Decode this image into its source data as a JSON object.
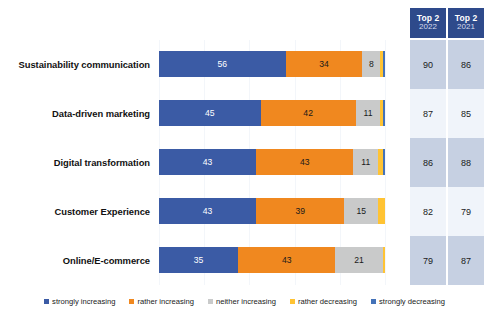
{
  "chart_data": {
    "type": "bar",
    "subtype": "stacked-horizontal-100",
    "title": "",
    "xlabel": "",
    "ylabel": "",
    "xlim": [
      0,
      100
    ],
    "grid": true,
    "legend_position": "bottom",
    "categories": [
      "Sustainability communication",
      "Data-driven marketing",
      "Digital transformation",
      "Customer Experience",
      "Online/E-commerce"
    ],
    "series": [
      {
        "name": "strongly increasing",
        "color": "#3B5BA5",
        "values": [
          56,
          45,
          43,
          43,
          35
        ]
      },
      {
        "name": "rather increasing",
        "color": "#F0881F",
        "values": [
          34,
          42,
          43,
          39,
          43
        ]
      },
      {
        "name": "neither increasing",
        "color": "#C9CACA",
        "values": [
          8,
          11,
          11,
          15,
          21
        ]
      },
      {
        "name": "rather decreasing",
        "color": "#FFC333",
        "values": [
          1,
          1,
          2,
          3,
          1
        ]
      },
      {
        "name": "strongly decreasing",
        "color": "#4472B8",
        "values": [
          1,
          1,
          1,
          0,
          0
        ]
      }
    ],
    "data_labels": {
      "strongly increasing": [
        "56",
        "45",
        "43",
        "43",
        "35"
      ],
      "rather increasing": [
        "34",
        "42",
        "43",
        "39",
        "43"
      ],
      "neither increasing": [
        "8",
        "11",
        "11",
        "15",
        "21"
      ],
      "rather decreasing": [
        "",
        "",
        "",
        "",
        ""
      ],
      "strongly decreasing": [
        "",
        "",
        "",
        "",
        ""
      ]
    },
    "annotation_columns": [
      {
        "title": "Top 2",
        "year": "2022",
        "values": [
          "90",
          "87",
          "86",
          "82",
          "79"
        ]
      },
      {
        "title": "Top 2",
        "year": "2021",
        "values": [
          "86",
          "85",
          "88",
          "79",
          "87"
        ]
      }
    ]
  },
  "header": {
    "columns": [
      {
        "title": "Top 2",
        "year": "2022"
      },
      {
        "title": "Top 2",
        "year": "2021"
      }
    ]
  },
  "rows": [
    {
      "label": "Sustainability communication",
      "segments": [
        {
          "key": "strong-inc",
          "value": 56,
          "label": "56"
        },
        {
          "key": "rather-inc",
          "value": 34,
          "label": "34"
        },
        {
          "key": "neither",
          "value": 8,
          "label": "8"
        },
        {
          "key": "rather-dec",
          "value": 1,
          "label": ""
        },
        {
          "key": "strong-dec",
          "value": 1,
          "label": ""
        }
      ],
      "top2_2022": "90",
      "top2_2021": "86"
    },
    {
      "label": "Data-driven marketing",
      "segments": [
        {
          "key": "strong-inc",
          "value": 45,
          "label": "45"
        },
        {
          "key": "rather-inc",
          "value": 42,
          "label": "42"
        },
        {
          "key": "neither",
          "value": 11,
          "label": "11"
        },
        {
          "key": "rather-dec",
          "value": 1,
          "label": ""
        },
        {
          "key": "strong-dec",
          "value": 1,
          "label": ""
        }
      ],
      "top2_2022": "87",
      "top2_2021": "85"
    },
    {
      "label": "Digital transformation",
      "segments": [
        {
          "key": "strong-inc",
          "value": 43,
          "label": "43"
        },
        {
          "key": "rather-inc",
          "value": 43,
          "label": "43"
        },
        {
          "key": "neither",
          "value": 11,
          "label": "11"
        },
        {
          "key": "rather-dec",
          "value": 2,
          "label": ""
        },
        {
          "key": "strong-dec",
          "value": 1,
          "label": ""
        }
      ],
      "top2_2022": "86",
      "top2_2021": "88"
    },
    {
      "label": "Customer Experience",
      "segments": [
        {
          "key": "strong-inc",
          "value": 43,
          "label": "43"
        },
        {
          "key": "rather-inc",
          "value": 39,
          "label": "39"
        },
        {
          "key": "neither",
          "value": 15,
          "label": "15"
        },
        {
          "key": "rather-dec",
          "value": 3,
          "label": ""
        },
        {
          "key": "strong-dec",
          "value": 0,
          "label": ""
        }
      ],
      "top2_2022": "82",
      "top2_2021": "79"
    },
    {
      "label": "Online/E-commerce",
      "segments": [
        {
          "key": "strong-inc",
          "value": 35,
          "label": "35"
        },
        {
          "key": "rather-inc",
          "value": 43,
          "label": "43"
        },
        {
          "key": "neither",
          "value": 21,
          "label": "21"
        },
        {
          "key": "rather-dec",
          "value": 1,
          "label": ""
        },
        {
          "key": "strong-dec",
          "value": 0,
          "label": ""
        }
      ],
      "top2_2022": "79",
      "top2_2021": "87"
    }
  ],
  "legend": {
    "items": [
      {
        "label": "strongly increasing",
        "color": "#3B5BA5"
      },
      {
        "label": "rather increasing",
        "color": "#F0881F"
      },
      {
        "label": "neither increasing",
        "color": "#C9CACA"
      },
      {
        "label": "rather decreasing",
        "color": "#FFC333"
      },
      {
        "label": "strongly decreasing",
        "color": "#4472B8"
      }
    ]
  },
  "colors": {
    "strongly_increasing": "#3B5BA5",
    "rather_increasing": "#F0881F",
    "neither_increasing": "#C9CACA",
    "rather_decreasing": "#FFC333",
    "strongly_decreasing": "#4472B8",
    "header_box": "#2E4A8B",
    "cell_shade_dark": "#C6D0E2",
    "cell_shade_light": "#F0F4FA"
  }
}
